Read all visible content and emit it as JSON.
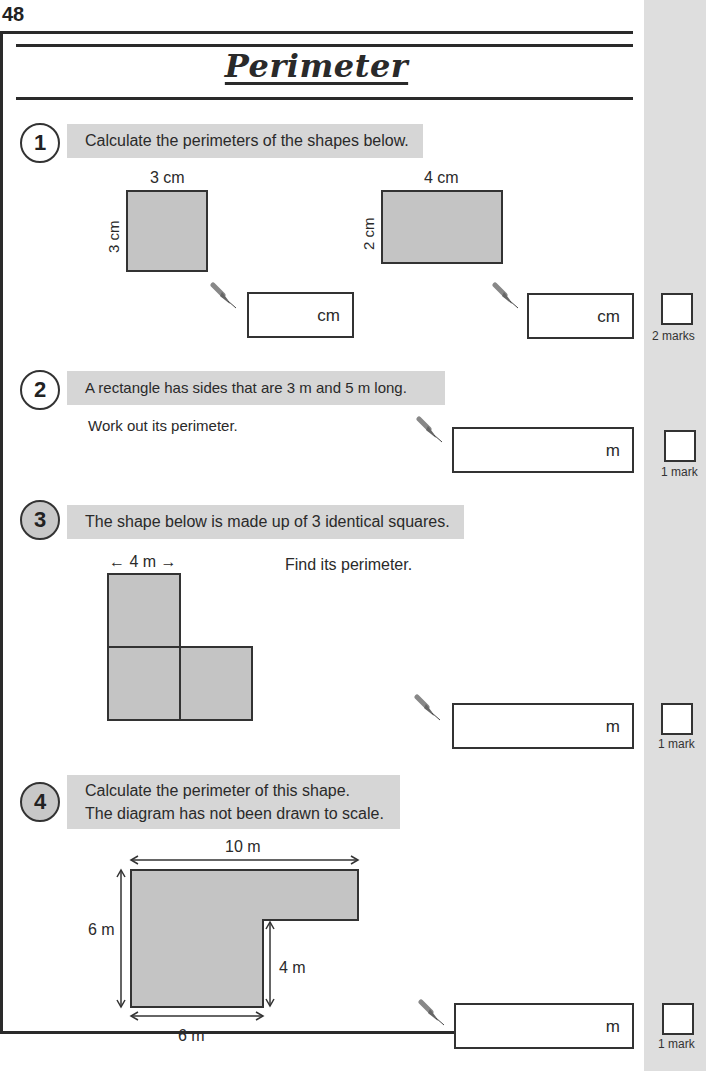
{
  "page": {
    "number": "48",
    "title": "Perimeter"
  },
  "questions": [
    {
      "number": "1",
      "prompt": "Calculate the perimeters of the shapes below.",
      "shapes": [
        {
          "top_label": "3 cm",
          "side_label": "3 cm"
        },
        {
          "top_label": "4 cm",
          "side_label": "2 cm"
        }
      ],
      "answers": [
        {
          "unit": "cm"
        },
        {
          "unit": "cm"
        }
      ],
      "marks": "2 marks"
    },
    {
      "number": "2",
      "prompt": "A rectangle has sides that are 3 m and 5 m long.",
      "instruction": "Work out its perimeter.",
      "answers": [
        {
          "unit": "m"
        }
      ],
      "marks": "1 mark"
    },
    {
      "number": "3",
      "prompt": "The shape below is made up of 3 identical squares.",
      "instruction": "Find its perimeter.",
      "dimension_label": "← 4 m →",
      "answers": [
        {
          "unit": "m"
        }
      ],
      "marks": "1 mark"
    },
    {
      "number": "4",
      "prompt_line1": "Calculate the perimeter of this shape.",
      "prompt_line2": "The diagram has not been drawn to scale.",
      "labels": {
        "top": "10 m",
        "left": "6 m",
        "inner": "4 m",
        "bottom": "6 m"
      },
      "answers": [
        {
          "unit": "m"
        }
      ],
      "marks": "1 mark"
    }
  ],
  "colors": {
    "shape_fill": "#c4c4c4",
    "banner_fill": "#d6d6d6",
    "margin_strip": "#dedede",
    "ink": "#2a2a2a"
  }
}
